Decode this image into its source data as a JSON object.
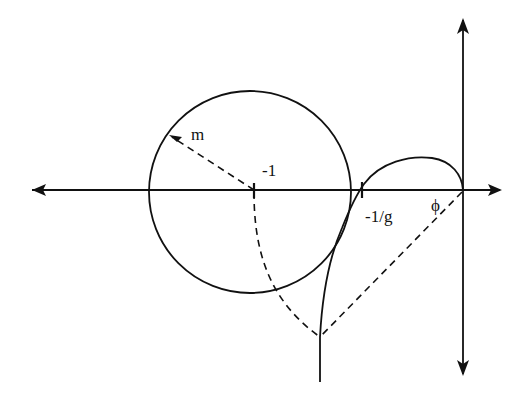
{
  "diagram": {
    "type": "nyquist-plot-with-m-circle",
    "labels": {
      "radius": "m",
      "center": "-1",
      "crossing": "-1/g",
      "angle": "ϕ"
    },
    "elements": [
      {
        "name": "real-axis",
        "style": "solid",
        "arrows": "both"
      },
      {
        "name": "imaginary-axis",
        "style": "solid",
        "arrows": "both"
      },
      {
        "name": "m-circle",
        "style": "solid",
        "center_label": "-1",
        "radius_label": "m"
      },
      {
        "name": "nyquist-curve",
        "style": "solid"
      },
      {
        "name": "radius-line",
        "style": "dashed"
      },
      {
        "name": "locus-arc",
        "style": "dashed"
      },
      {
        "name": "phase-line",
        "style": "dashed",
        "label": "ϕ"
      }
    ],
    "colors": {
      "stroke": "#111111",
      "background": "#ffffff"
    }
  }
}
